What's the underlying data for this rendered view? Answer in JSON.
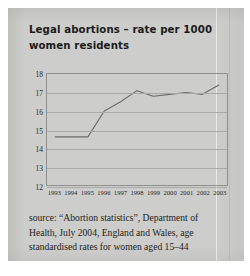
{
  "title": "Legal abortions – rate per 1000 women residents",
  "source": "source: “Abortion statistics”, Department of Health, July 2004, England and Wales, age standardised rates for women aged 15–44",
  "chart_data": {
    "type": "line",
    "title": "Legal abortions – rate per 1000 women residents",
    "xlabel": "",
    "ylabel": "",
    "x": [
      "1993",
      "1994",
      "1995",
      "1996",
      "1997",
      "1998",
      "1999",
      "2000",
      "2001",
      "2002",
      "2003"
    ],
    "values": [
      14.6,
      14.6,
      14.6,
      16.0,
      16.5,
      17.1,
      16.8,
      16.9,
      17.0,
      16.9,
      17.4
    ],
    "ylim": [
      12,
      18
    ],
    "yticks": [
      18,
      17,
      16,
      15,
      14,
      13,
      12
    ],
    "grid": true,
    "legend": false,
    "series": [
      {
        "name": "Legal abortion rate per 1000 women residents",
        "values": [
          14.6,
          14.6,
          14.6,
          16.0,
          16.5,
          17.1,
          16.8,
          16.9,
          17.0,
          16.9,
          17.4
        ]
      }
    ],
    "line_color": "#6b6b69"
  }
}
